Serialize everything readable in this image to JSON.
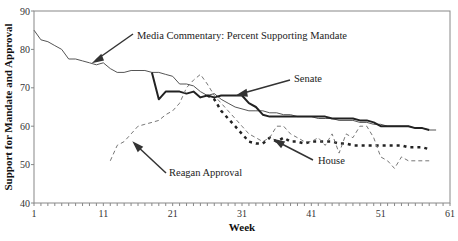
{
  "chart_data": {
    "type": "line",
    "title": "",
    "xlabel": "Week",
    "ylabel": "Support for Mandate and Approval",
    "xlim": [
      1,
      61
    ],
    "ylim": [
      40,
      90
    ],
    "x_ticks": [
      1,
      11,
      21,
      31,
      41,
      51,
      61
    ],
    "y_ticks": [
      40,
      50,
      60,
      70,
      80,
      90
    ],
    "grid": false,
    "legend": "none (inline annotations with arrows)",
    "series": [
      {
        "name": "Media Commentary: Percent Supporting Mandate",
        "style": "thin solid",
        "color": "#555555",
        "x": [
          1,
          2,
          3,
          4,
          5,
          6,
          7,
          8,
          9,
          10,
          11,
          12,
          13,
          14,
          15,
          16,
          17,
          18,
          19,
          20,
          21,
          22,
          23,
          24,
          25,
          26,
          27,
          28,
          29,
          30,
          31,
          32,
          33,
          34,
          35,
          36,
          37,
          38,
          39,
          40,
          41,
          42,
          43,
          44,
          45,
          46,
          47,
          48,
          49,
          50,
          51,
          52,
          53,
          54,
          55,
          56,
          57,
          58,
          59
        ],
        "values": [
          85,
          82.5,
          82,
          81,
          80,
          77.5,
          77.5,
          77,
          76.5,
          76,
          76.5,
          75,
          74,
          74,
          74.5,
          74.5,
          74.5,
          74,
          74,
          73.5,
          73,
          71,
          71,
          70.5,
          69,
          68,
          68.5,
          67,
          66,
          65,
          64.5,
          64,
          64,
          64,
          63.5,
          63.5,
          63,
          63,
          62.5,
          62.5,
          62.5,
          62,
          62,
          62,
          61.5,
          61.5,
          61.5,
          61,
          61,
          60.5,
          60.5,
          60,
          60,
          60,
          60,
          59.5,
          59.5,
          59,
          59
        ]
      },
      {
        "name": "Senate",
        "style": "thick solid",
        "color": "#222222",
        "x": [
          18,
          19,
          20,
          21,
          22,
          23,
          24,
          25,
          26,
          27,
          28,
          29,
          30,
          31,
          32,
          33,
          34,
          35,
          36,
          37,
          38,
          39,
          40,
          41,
          42,
          43,
          44,
          45,
          46,
          47,
          48,
          49,
          50,
          51,
          52,
          53,
          54,
          55,
          56,
          57,
          58
        ],
        "values": [
          74,
          67,
          69,
          69,
          69,
          68.5,
          69,
          67.5,
          68,
          67.5,
          68,
          68,
          68,
          68,
          66,
          65,
          63,
          62.5,
          62.5,
          62.5,
          62.5,
          62.5,
          62.5,
          62.5,
          62.5,
          62.5,
          62,
          62,
          62,
          62,
          61.5,
          61.5,
          61,
          60,
          60,
          60,
          60,
          60,
          59.5,
          59.5,
          59
        ]
      },
      {
        "name": "House",
        "style": "thick dotted",
        "color": "#222222",
        "x": [
          26,
          27,
          28,
          29,
          30,
          31,
          32,
          33,
          34,
          35,
          36,
          37,
          38,
          39,
          40,
          41,
          42,
          43,
          44,
          45,
          46,
          47,
          48,
          49,
          50,
          51,
          52,
          53,
          54,
          55,
          56,
          57,
          58
        ],
        "values": [
          68,
          67,
          64,
          62,
          60,
          58,
          56,
          55.5,
          55.5,
          57,
          56,
          57,
          56,
          56,
          55.5,
          56,
          56,
          56,
          56,
          55.5,
          55.5,
          55,
          55,
          55,
          55,
          55,
          55,
          55,
          55,
          54.5,
          54.5,
          54.5,
          54
        ]
      },
      {
        "name": "Reagan Approval",
        "style": "thin dashed",
        "color": "#777777",
        "x": [
          12,
          13,
          14,
          15,
          16,
          17,
          18,
          19,
          20,
          21,
          22,
          23,
          24,
          25,
          26,
          27,
          28,
          29,
          30,
          31,
          32,
          33,
          34,
          35,
          36,
          37,
          38,
          39,
          40,
          41,
          42,
          43,
          44,
          45,
          46,
          47,
          48,
          49,
          50,
          51,
          52,
          53,
          54,
          55,
          56,
          57,
          58
        ],
        "values": [
          51,
          55,
          56,
          58,
          60,
          60.5,
          61,
          61.5,
          63,
          64,
          66,
          70,
          72,
          73.5,
          71,
          68,
          66,
          64,
          62,
          60,
          58,
          57,
          56,
          57,
          60,
          60,
          58,
          57,
          56,
          56,
          57,
          55,
          58,
          53,
          58,
          57,
          60,
          60,
          57,
          52,
          51,
          49,
          52,
          51,
          51,
          51,
          51
        ]
      }
    ],
    "annotations": [
      {
        "text": "Media Commentary: Percent Supporting Mandate",
        "points_to_week": 9
      },
      {
        "text": "Senate",
        "points_to_week": 30
      },
      {
        "text": "House",
        "points_to_week": 34
      },
      {
        "text": "Reagan Approval",
        "points_to_week": 14
      }
    ]
  },
  "labels": {
    "xlabel": "Week",
    "ylabel": "Support for Mandate and Approval",
    "media": "Media Commentary: Percent Supporting Mandate",
    "senate": "Senate",
    "house": "House",
    "reagan": "Reagan Approval"
  }
}
